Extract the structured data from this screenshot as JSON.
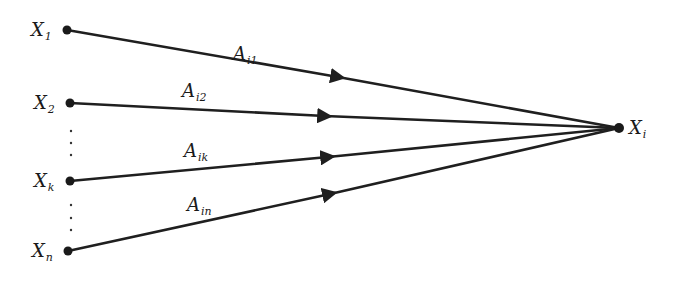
{
  "diagram": {
    "type": "directed-graph",
    "colors": {
      "stroke": "#1f1f1f",
      "background": "#ffffff"
    },
    "target": {
      "label": "X",
      "sub": "i",
      "x": 619,
      "y": 128
    },
    "sources": [
      {
        "id": "x1",
        "label": "X",
        "sub": "1",
        "x": 67,
        "y": 30,
        "edge": {
          "label": "A",
          "sub": "i1",
          "lx": 233,
          "ly": 60,
          "ax": 338,
          "ay": 77
        }
      },
      {
        "id": "x2",
        "label": "X",
        "sub": "2",
        "x": 70,
        "y": 103,
        "edge": {
          "label": "A",
          "sub": "i2",
          "lx": 182,
          "ly": 97,
          "ax": 325,
          "ay": 116
        }
      },
      {
        "id": "xk",
        "label": "X",
        "sub": "k",
        "x": 70,
        "y": 181,
        "edge": {
          "label": "A",
          "sub": "ik",
          "lx": 184,
          "ly": 157,
          "ax": 328,
          "ay": 157
        }
      },
      {
        "id": "xn",
        "label": "X",
        "sub": "n",
        "x": 68,
        "y": 251,
        "edge": {
          "label": "A",
          "sub": "in",
          "lx": 187,
          "ly": 211,
          "ax": 330,
          "ay": 194
        }
      }
    ],
    "ellipses": [
      {
        "x": 71,
        "ys": [
          131,
          143,
          155
        ]
      },
      {
        "x": 71,
        "ys": [
          205,
          218,
          230
        ]
      }
    ]
  }
}
